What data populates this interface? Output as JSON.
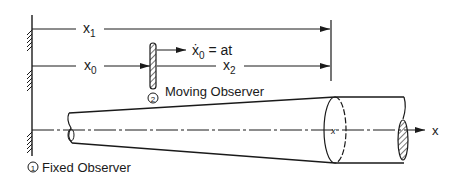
{
  "diagram": {
    "labels": {
      "x1": "x",
      "x1_sub": "1",
      "x0": "x",
      "x0_sub": "0",
      "x2": "x",
      "x2_sub": "2",
      "velocity_var": "ẋ",
      "velocity_sub": "0",
      "velocity_eq": " = at",
      "axis": "x",
      "moving_observer_num": "2",
      "moving_observer": "Moving Observer",
      "fixed_observer_num": "1",
      "fixed_observer": "Fixed Observer"
    },
    "colors": {
      "ink": "#1a1a1a",
      "background": "#ffffff"
    }
  }
}
